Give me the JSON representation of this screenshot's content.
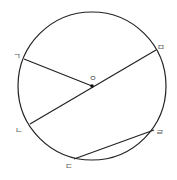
{
  "diagram": {
    "type": "circle-geometry",
    "colors": {
      "stroke": "#222222",
      "label": "#555555",
      "background": "#ffffff"
    },
    "circle": {
      "center": {
        "x": 92,
        "y": 86
      },
      "radius": 74
    },
    "center_point": {
      "label": "ㅇ",
      "x": 92,
      "y": 86,
      "label_x": 90,
      "label_y": 80
    },
    "points": [
      {
        "id": "giyeok",
        "label": "ㄱ",
        "x": 24,
        "y": 59,
        "label_x": 14,
        "label_y": 58
      },
      {
        "id": "nieun",
        "label": "ㄴ",
        "x": 30,
        "y": 124,
        "label_x": 16,
        "label_y": 132
      },
      {
        "id": "digeut",
        "label": "ㄷ",
        "x": 74,
        "y": 159,
        "label_x": 65,
        "label_y": 168
      },
      {
        "id": "rieul",
        "label": "ㄹ",
        "x": 154,
        "y": 130,
        "label_x": 156,
        "label_y": 134
      },
      {
        "id": "mieum",
        "label": "ㅁ",
        "x": 156,
        "y": 50,
        "label_x": 157,
        "label_y": 49
      }
    ],
    "segments": [
      {
        "name": "radius-giyeok-o",
        "from": "ㄱ",
        "to": "ㅇ"
      },
      {
        "name": "diameter-nieun-mieum",
        "from": "ㄴ",
        "to": "ㅁ"
      },
      {
        "name": "chord-digeut-rieul",
        "from": "ㄷ",
        "to": "ㄹ"
      }
    ]
  }
}
